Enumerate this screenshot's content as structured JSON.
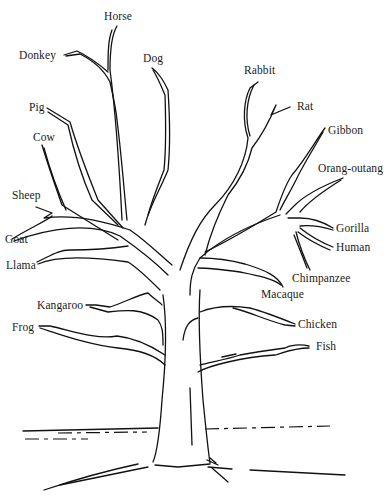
{
  "diagram": {
    "type": "tree",
    "colors": {
      "ink": "#111111",
      "background": "#ffffff"
    },
    "labels": {
      "horse": "Horse",
      "donkey": "Donkey",
      "dog": "Dog",
      "rabbit": "Rabbit",
      "rat": "Rat",
      "pig": "Pig",
      "cow": "Cow",
      "gibbon": "Gibbon",
      "orang_outang": "Orang-outang",
      "sheep": "Sheep",
      "goat": "Goat",
      "gorilla": "Gorilla",
      "human": "Human",
      "llama": "Llama",
      "chimpanzee": "Chimpanzee",
      "macaque": "Macaque",
      "kangaroo": "Kangaroo",
      "chicken": "Chicken",
      "frog": "Frog",
      "fish": "Fish"
    }
  }
}
